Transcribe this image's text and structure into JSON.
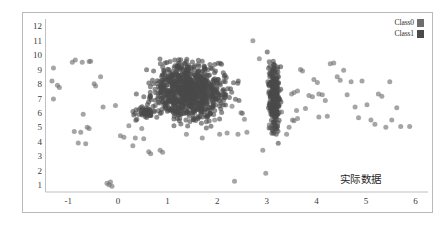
{
  "annotation": {
    "text": "实际数据"
  },
  "legend": {
    "position": "top-right",
    "items": [
      {
        "label": "Class0",
        "color": "#6e6e6e"
      },
      {
        "label": "Class1",
        "color": "#4a4a4a"
      }
    ]
  },
  "axes": {
    "x_ticks": [
      "-1",
      "0",
      "1",
      "2",
      "3",
      "4",
      "5",
      "6"
    ],
    "y_ticks": [
      "1",
      "2",
      "3",
      "4",
      "5",
      "6",
      "7",
      "8",
      "9",
      "10",
      "11",
      "12"
    ],
    "axis_color": "#c0c0c0",
    "frame_color": "#b9b9b9"
  },
  "chart_data": {
    "type": "scatter",
    "title": "",
    "xlabel": "",
    "ylabel": "",
    "xlim": [
      -1.45,
      6.25
    ],
    "ylim": [
      0.55,
      12.55
    ],
    "xticks": [
      -1,
      0,
      1,
      2,
      3,
      4,
      5,
      6
    ],
    "yticks": [
      1,
      2,
      3,
      4,
      5,
      6,
      7,
      8,
      9,
      10,
      11,
      12
    ],
    "grid": false,
    "legend_position": "top-right",
    "annotations": [
      {
        "text": "实际数据",
        "x": 4.05,
        "y": 2.85
      }
    ],
    "marker": {
      "shape": "circle",
      "size": 5,
      "opacity": 0.62
    },
    "series": [
      {
        "name": "Class0",
        "color": "#6e6e6e",
        "points": [
          [
            -1.3,
            9.15
          ],
          [
            -1.33,
            8.25
          ],
          [
            -1.3,
            7.0
          ],
          [
            -1.22,
            7.95
          ],
          [
            -1.18,
            7.8
          ],
          [
            -0.92,
            9.55
          ],
          [
            -0.86,
            9.7
          ],
          [
            -0.72,
            9.55
          ],
          [
            -0.58,
            9.6
          ],
          [
            -0.55,
            9.62
          ],
          [
            -0.88,
            4.75
          ],
          [
            -0.75,
            4.7
          ],
          [
            -0.7,
            5.95
          ],
          [
            -0.62,
            5.05
          ],
          [
            -0.58,
            4.95
          ],
          [
            -0.8,
            3.95
          ],
          [
            -0.65,
            3.9
          ],
          [
            -0.48,
            8.05
          ],
          [
            -0.45,
            7.9
          ],
          [
            -0.35,
            8.55
          ],
          [
            -0.3,
            6.45
          ],
          [
            -0.22,
            1.15
          ],
          [
            -0.18,
            1.05
          ],
          [
            -0.15,
            1.25
          ],
          [
            -0.12,
            0.95
          ],
          [
            0.05,
            4.45
          ],
          [
            0.12,
            4.35
          ],
          [
            0.3,
            3.75
          ],
          [
            0.35,
            4.3
          ],
          [
            0.52,
            4.25
          ],
          [
            0.62,
            3.35
          ],
          [
            0.66,
            3.2
          ],
          [
            0.85,
            3.45
          ],
          [
            0.9,
            3.3
          ],
          [
            1.38,
            4.55
          ],
          [
            1.7,
            4.3
          ],
          [
            2.05,
            4.55
          ],
          [
            2.2,
            4.65
          ],
          [
            2.35,
            1.3
          ],
          [
            2.42,
            4.55
          ],
          [
            2.55,
            5.6
          ],
          [
            2.6,
            4.7
          ],
          [
            2.72,
            11.05
          ],
          [
            2.85,
            9.8
          ],
          [
            2.98,
            1.85
          ],
          [
            2.92,
            3.45
          ],
          [
            3.05,
            5.2
          ],
          [
            3.4,
            4.55
          ],
          [
            3.45,
            5.05
          ],
          [
            3.52,
            5.55
          ],
          [
            3.55,
            5.5
          ],
          [
            3.62,
            5.65
          ],
          [
            3.6,
            6.2
          ],
          [
            3.5,
            7.35
          ],
          [
            3.55,
            7.45
          ],
          [
            3.62,
            7.55
          ],
          [
            3.68,
            9.05
          ],
          [
            3.72,
            8.95
          ],
          [
            3.85,
            7.25
          ],
          [
            3.92,
            7.15
          ],
          [
            3.78,
            6.35
          ],
          [
            3.95,
            8.35
          ],
          [
            4.02,
            8.15
          ],
          [
            4.05,
            7.35
          ],
          [
            4.12,
            7.3
          ],
          [
            4.18,
            6.9
          ],
          [
            4.22,
            5.8
          ],
          [
            4.05,
            5.75
          ],
          [
            4.28,
            9.45
          ],
          [
            4.35,
            9.5
          ],
          [
            4.42,
            8.55
          ],
          [
            4.48,
            8.3
          ],
          [
            4.55,
            9.0
          ],
          [
            4.62,
            7.3
          ],
          [
            4.7,
            8.2
          ],
          [
            4.78,
            6.45
          ],
          [
            4.85,
            5.7
          ],
          [
            4.92,
            8.25
          ],
          [
            5.02,
            6.6
          ],
          [
            5.1,
            5.55
          ],
          [
            5.18,
            5.25
          ],
          [
            5.25,
            7.35
          ],
          [
            5.32,
            7.2
          ],
          [
            5.4,
            5.05
          ],
          [
            5.48,
            8.2
          ],
          [
            5.52,
            5.55
          ],
          [
            5.62,
            6.4
          ],
          [
            5.7,
            5.1
          ],
          [
            5.88,
            5.1
          ],
          [
            2.48,
            6.05
          ],
          [
            2.3,
            6.5
          ],
          [
            1.95,
            5.55
          ],
          [
            0.22,
            5.15
          ],
          [
            0.48,
            4.95
          ],
          [
            -0.05,
            6.55
          ],
          [
            3.3,
            6.1
          ]
        ]
      },
      {
        "name": "Class1",
        "color": "#4a4a4a",
        "description": "Large dense elliptical cloud centered near (1.45, 7.5) plus a narrow vertical band near x=3.15",
        "clusters": [
          {
            "center": [
              1.45,
              7.55
            ],
            "spread": [
              0.62,
              1.55
            ],
            "n": 900
          },
          {
            "center": [
              3.15,
              7.2
            ],
            "spread": [
              0.09,
              1.85
            ],
            "n": 260
          },
          {
            "center": [
              0.55,
              6.05
            ],
            "spread": [
              0.22,
              0.35
            ],
            "n": 45
          }
        ]
      }
    ]
  }
}
